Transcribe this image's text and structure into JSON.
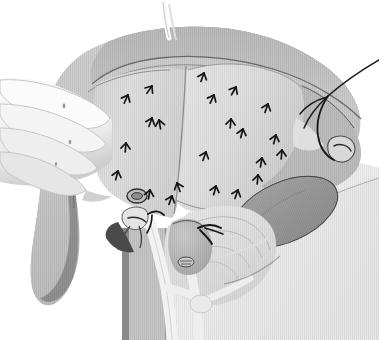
{
  "image": {
    "kind": "medical-surgical-illustration",
    "style": "grayscale-halftone-line-art",
    "width": 379,
    "height": 340,
    "background_color": "#ffffff",
    "title": "Open cholecystectomy exposure — liver retracted, dissection plane marked",
    "has_visible_text": false,
    "caption": ""
  },
  "palette": {
    "background": "#ffffff",
    "liver_mid": "#8a8a8a",
    "liver_dark": "#6f6f6f",
    "liver_edge_dark": "#5a5a5a",
    "organ_dark": "#565656",
    "flap_light": "#c2c2c2",
    "flap_lighter": "#d3d3d3",
    "peritoneum_pale": "#dcdcdc",
    "body_wall_pale": "#d0d0d0",
    "glove_white": "#f2f2f2",
    "glove_shadow": "#cfcfcf",
    "duct_white": "#efefef",
    "ink_black": "#141414",
    "outline": "#3c3c3c",
    "clip_gray": "#9a9a9a",
    "vessel_mid": "#7a7a7a"
  },
  "structures": [
    {
      "name": "liver",
      "label": "Liver (retracted superiorly)",
      "tone": "#8a8a8a"
    },
    {
      "name": "liver-inferior-edge",
      "label": "Inferior hepatic border",
      "tone": "#6f6f6f"
    },
    {
      "name": "gallbladder-bed-flap",
      "label": "Dissected serosal flap / gallbladder bed",
      "tone": "#c2c2c2"
    },
    {
      "name": "hepatoduodenal-ligament",
      "label": "Hepatoduodenal ligament",
      "tone": "#d3d3d3"
    },
    {
      "name": "cystic-duct",
      "label": "Cystic duct",
      "tone": "#efefef"
    },
    {
      "name": "common-bile-duct",
      "label": "Common bile duct",
      "tone": "#efefef"
    },
    {
      "name": "gallbladder-remnant",
      "label": "Gallbladder / infundibulum",
      "tone": "#9a9a9a"
    },
    {
      "name": "duodenum",
      "label": "Duodenum",
      "tone": "#565656"
    },
    {
      "name": "abdominal-wall",
      "label": "Abdominal wall / drape",
      "tone": "#d0d0d0"
    },
    {
      "name": "retractor-blade",
      "label": "Retractor blade",
      "tone": "#8f8f8f"
    }
  ],
  "instruments": [
    {
      "name": "surgeons-gloved-hand",
      "label": "Surgeon's gloved hand retracting liver",
      "fingers": 4
    },
    {
      "name": "suture-needle",
      "label": "Curved suture needle with thread"
    },
    {
      "name": "suture-thread",
      "label": "Suture thread running to upper right"
    },
    {
      "name": "surgical-clip-upper",
      "label": "Surgical clip on cystic artery"
    },
    {
      "name": "surgical-clip-lower",
      "label": "Surgical clip on cystic duct"
    },
    {
      "name": "ligature-tie",
      "label": "Ligature tie"
    }
  ],
  "annotation_arrows": {
    "label": "Dissection-plane arrow markers",
    "count": 22,
    "color": "#141414",
    "points": [
      {
        "x": 128,
        "y": 95,
        "rot": 205
      },
      {
        "x": 152,
        "y": 118,
        "rot": 200
      },
      {
        "x": 126,
        "y": 143,
        "rot": 185
      },
      {
        "x": 159,
        "y": 120,
        "rot": 170
      },
      {
        "x": 118,
        "y": 171,
        "rot": 195
      },
      {
        "x": 152,
        "y": 86,
        "rot": 215
      },
      {
        "x": 150,
        "y": 190,
        "rot": 190
      },
      {
        "x": 172,
        "y": 196,
        "rot": 200
      },
      {
        "x": 177,
        "y": 183,
        "rot": 160
      },
      {
        "x": 204,
        "y": 73,
        "rot": 200
      },
      {
        "x": 214,
        "y": 95,
        "rot": 205
      },
      {
        "x": 231,
        "y": 119,
        "rot": 185
      },
      {
        "x": 243,
        "y": 129,
        "rot": 195
      },
      {
        "x": 236,
        "y": 87,
        "rot": 210
      },
      {
        "x": 268,
        "y": 104,
        "rot": 200
      },
      {
        "x": 276,
        "y": 135,
        "rot": 195
      },
      {
        "x": 282,
        "y": 150,
        "rot": 185
      },
      {
        "x": 262,
        "y": 158,
        "rot": 190
      },
      {
        "x": 216,
        "y": 186,
        "rot": 195
      },
      {
        "x": 238,
        "y": 190,
        "rot": 200
      },
      {
        "x": 258,
        "y": 175,
        "rot": 185
      },
      {
        "x": 206,
        "y": 152,
        "rot": 200
      }
    ]
  }
}
